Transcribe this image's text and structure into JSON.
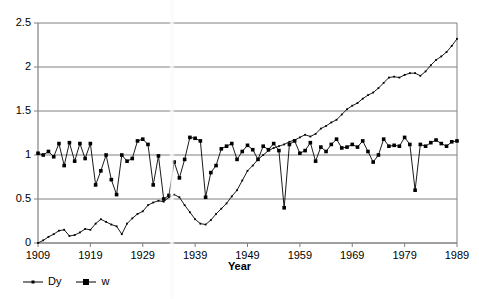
{
  "chart_data": {
    "type": "line",
    "title": "",
    "xlabel": "Year",
    "ylabel": "",
    "xlim": [
      1909,
      1989
    ],
    "ylim": [
      0,
      2.5
    ],
    "yticks": [
      "0",
      "0.5",
      "1",
      "1.5",
      "2",
      "2.5"
    ],
    "ytick_values": [
      0,
      0.5,
      1,
      1.5,
      2,
      2.5
    ],
    "xticks": [
      "1909",
      "1919",
      "1929",
      "1939",
      "1949",
      "1959",
      "1969",
      "1979",
      "1989"
    ],
    "xtick_values": [
      1909,
      1919,
      1929,
      1939,
      1949,
      1959,
      1969,
      1979,
      1989
    ],
    "grid": "horizontal",
    "legend_position": "bottom-left",
    "series": [
      {
        "name": "Dy",
        "marker": "small-dot",
        "color": "#000000",
        "x": [
          1909,
          1910,
          1911,
          1912,
          1913,
          1914,
          1915,
          1916,
          1917,
          1918,
          1919,
          1920,
          1921,
          1922,
          1923,
          1924,
          1925,
          1926,
          1927,
          1928,
          1929,
          1930,
          1931,
          1932,
          1933,
          1934,
          1935,
          1936,
          1937,
          1938,
          1939,
          1940,
          1941,
          1942,
          1943,
          1944,
          1945,
          1946,
          1947,
          1948,
          1949,
          1950,
          1951,
          1952,
          1953,
          1954,
          1955,
          1956,
          1957,
          1958,
          1959,
          1960,
          1961,
          1962,
          1963,
          1964,
          1965,
          1966,
          1967,
          1968,
          1969,
          1970,
          1971,
          1972,
          1973,
          1974,
          1975,
          1976,
          1977,
          1978,
          1979,
          1980,
          1981,
          1982,
          1983,
          1984,
          1985,
          1986,
          1987,
          1988,
          1989
        ],
        "values": [
          0.0,
          0.03,
          0.07,
          0.1,
          0.14,
          0.15,
          0.08,
          0.09,
          0.12,
          0.16,
          0.15,
          0.22,
          0.27,
          0.24,
          0.21,
          0.19,
          0.1,
          0.22,
          0.28,
          0.33,
          0.36,
          0.43,
          0.46,
          0.48,
          0.47,
          0.52,
          0.55,
          0.52,
          0.43,
          0.35,
          0.27,
          0.22,
          0.21,
          0.26,
          0.33,
          0.39,
          0.45,
          0.53,
          0.6,
          0.71,
          0.82,
          0.88,
          0.95,
          1.0,
          1.05,
          1.08,
          1.1,
          1.12,
          1.15,
          1.17,
          1.2,
          1.23,
          1.21,
          1.24,
          1.3,
          1.33,
          1.37,
          1.4,
          1.46,
          1.52,
          1.56,
          1.59,
          1.64,
          1.68,
          1.71,
          1.76,
          1.82,
          1.88,
          1.89,
          1.88,
          1.91,
          1.93,
          1.93,
          1.9,
          1.95,
          2.02,
          2.08,
          2.12,
          2.17,
          2.24,
          2.32
        ]
      },
      {
        "name": "w",
        "marker": "filled-square",
        "color": "#000000",
        "x": [
          1909,
          1910,
          1911,
          1912,
          1913,
          1914,
          1915,
          1916,
          1917,
          1918,
          1919,
          1920,
          1921,
          1922,
          1923,
          1924,
          1925,
          1926,
          1927,
          1928,
          1929,
          1930,
          1931,
          1932,
          1933,
          1934,
          1935,
          1936,
          1937,
          1938,
          1939,
          1940,
          1941,
          1942,
          1943,
          1944,
          1945,
          1946,
          1947,
          1948,
          1949,
          1950,
          1951,
          1952,
          1953,
          1954,
          1955,
          1956,
          1957,
          1958,
          1959,
          1960,
          1961,
          1962,
          1963,
          1964,
          1965,
          1966,
          1967,
          1968,
          1969,
          1970,
          1971,
          1972,
          1973,
          1974,
          1975,
          1976,
          1977,
          1978,
          1979,
          1980,
          1981,
          1982,
          1983,
          1984,
          1985,
          1986,
          1987,
          1988,
          1989
        ],
        "values": [
          1.02,
          1.0,
          1.04,
          0.98,
          1.13,
          0.88,
          1.14,
          0.93,
          1.13,
          0.96,
          1.13,
          0.66,
          0.82,
          1.0,
          0.72,
          0.55,
          1.0,
          0.93,
          0.96,
          1.16,
          1.18,
          1.12,
          0.66,
          0.99,
          0.5,
          0.54,
          0.92,
          0.74,
          0.95,
          1.2,
          1.19,
          1.16,
          0.52,
          0.8,
          0.88,
          1.07,
          1.1,
          1.13,
          0.95,
          1.04,
          1.11,
          1.06,
          0.95,
          1.1,
          1.06,
          1.13,
          1.05,
          0.4,
          1.12,
          1.16,
          1.02,
          1.05,
          1.14,
          0.93,
          1.09,
          1.04,
          1.12,
          1.18,
          1.08,
          1.09,
          1.12,
          1.09,
          1.16,
          1.04,
          0.92,
          1.0,
          1.18,
          1.1,
          1.11,
          1.1,
          1.2,
          1.12,
          0.6,
          1.12,
          1.1,
          1.14,
          1.17,
          1.13,
          1.1,
          1.15,
          1.16
        ]
      }
    ]
  },
  "legend": {
    "items": [
      {
        "label": "Dy"
      },
      {
        "label": "w"
      }
    ]
  },
  "axis": {
    "x_title": "Year"
  }
}
